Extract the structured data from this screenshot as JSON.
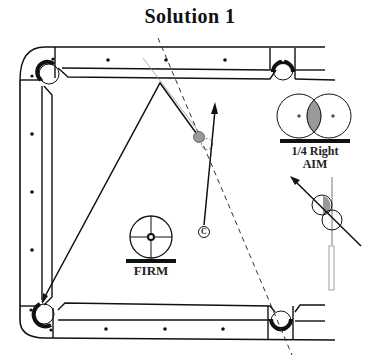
{
  "title": "Solution 1",
  "labels": {
    "aim_line1": "1/4 Right",
    "aim_line2": "AIM",
    "stroke": "FIRM",
    "cue_ball_marker": "C"
  },
  "diagram": {
    "table": {
      "diamonds_top": 3,
      "diamonds_bottom": 3,
      "diamonds_left": 3,
      "pockets": [
        "top-left-corner",
        "top-side",
        "bottom-left-corner",
        "bottom-side"
      ]
    },
    "object_ball_color": "#999999",
    "aim_overlap_fill": "#999999",
    "line_color": "#111111"
  }
}
